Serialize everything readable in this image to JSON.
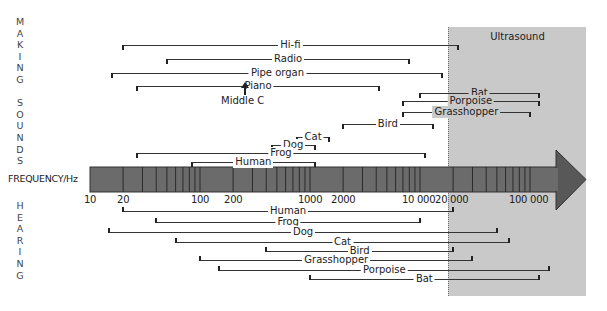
{
  "title_making": "MAKING SOUNDS",
  "title_hearing": "HEARING",
  "axis_label": "FREQUENCY/Hz",
  "ultrasound_label": "Ultrasound",
  "middle_c_label": "Middle C",
  "colors": {
    "bar_fill": "#6b6b6b",
    "bar_dark": "#555555",
    "ultrasound_bg": "#c9c9c9",
    "line": "#222222"
  },
  "chart_data": {
    "type": "range",
    "xlabel": "FREQUENCY/Hz",
    "scale": "log",
    "xlim": [
      10,
      150000
    ],
    "tick_labels": [
      "10",
      "20",
      "100",
      "200",
      "1000",
      "2000",
      "10 000",
      "20 000",
      "100 000"
    ],
    "ultrasound_threshold_hz": 20000,
    "making_sounds": [
      {
        "name": "Hi-fi",
        "min": 20,
        "max": 22000
      },
      {
        "name": "Radio",
        "min": 50,
        "max": 8000
      },
      {
        "name": "Pipe organ",
        "min": 16,
        "max": 16000
      },
      {
        "name": "Piano",
        "min": 27,
        "max": 4200
      },
      {
        "name": "Bat",
        "min": 10000,
        "max": 120000
      },
      {
        "name": "Porpoise",
        "min": 7000,
        "max": 120000
      },
      {
        "name": "Grasshopper",
        "min": 7000,
        "max": 100000
      },
      {
        "name": "Bird",
        "min": 2000,
        "max": 13000
      },
      {
        "name": "Cat",
        "min": 760,
        "max": 1500
      },
      {
        "name": "Dog",
        "min": 450,
        "max": 1100
      },
      {
        "name": "Frog",
        "min": 27,
        "max": 11000
      },
      {
        "name": "Human",
        "min": 85,
        "max": 1100
      }
    ],
    "hearing": [
      {
        "name": "Human",
        "min": 20,
        "max": 20000
      },
      {
        "name": "Frog",
        "min": 40,
        "max": 10000
      },
      {
        "name": "Dog",
        "min": 15,
        "max": 50000
      },
      {
        "name": "Cat",
        "min": 60,
        "max": 65000
      },
      {
        "name": "Bird",
        "min": 400,
        "max": 20000
      },
      {
        "name": "Grasshopper",
        "min": 100,
        "max": 30000
      },
      {
        "name": "Porpoise",
        "min": 150,
        "max": 150000
      },
      {
        "name": "Bat",
        "min": 1000,
        "max": 120000
      }
    ],
    "annotations": [
      "Middle C",
      "Ultrasound"
    ]
  }
}
